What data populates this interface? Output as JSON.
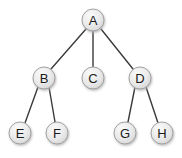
{
  "diagram": {
    "type": "tree",
    "title": "",
    "canvas": {
      "width": 182,
      "height": 158,
      "background": "#ffffff"
    },
    "style": {
      "node_fill_top": "#f2f2f2",
      "node_fill_bottom": "#d9d9d9",
      "node_stroke": "#9a9a9a",
      "node_radius": 11,
      "node_label_color": "#1a1a1a",
      "edge_color": "#3a3a3a",
      "edge_width": 1.4,
      "shadow_color": "#c9c9c9"
    },
    "nodes": [
      {
        "id": "A",
        "label": "A",
        "cx": 93,
        "cy": 20,
        "level": 0
      },
      {
        "id": "B",
        "label": "B",
        "cx": 44,
        "cy": 78,
        "level": 1
      },
      {
        "id": "C",
        "label": "C",
        "cx": 93,
        "cy": 78,
        "level": 1
      },
      {
        "id": "D",
        "label": "D",
        "cx": 140,
        "cy": 78,
        "level": 1
      },
      {
        "id": "E",
        "label": "E",
        "cx": 20,
        "cy": 133,
        "level": 2
      },
      {
        "id": "F",
        "label": "F",
        "cx": 57,
        "cy": 133,
        "level": 2
      },
      {
        "id": "G",
        "label": "G",
        "cx": 125,
        "cy": 133,
        "level": 2
      },
      {
        "id": "H",
        "label": "H",
        "cx": 162,
        "cy": 133,
        "level": 2
      }
    ],
    "edges": [
      {
        "from": "A",
        "to": "B",
        "x1": 86,
        "y1": 29,
        "x2": 51,
        "y2": 69
      },
      {
        "from": "A",
        "to": "C",
        "x1": 93,
        "y1": 31,
        "x2": 93,
        "y2": 67
      },
      {
        "from": "A",
        "to": "D",
        "x1": 101,
        "y1": 29,
        "x2": 133,
        "y2": 69
      },
      {
        "from": "B",
        "to": "E",
        "x1": 38,
        "y1": 87,
        "x2": 25,
        "y2": 123
      },
      {
        "from": "B",
        "to": "F",
        "x1": 49,
        "y1": 87,
        "x2": 55,
        "y2": 122
      },
      {
        "from": "D",
        "to": "G",
        "x1": 135,
        "y1": 87,
        "x2": 128,
        "y2": 122
      },
      {
        "from": "D",
        "to": "H",
        "x1": 146,
        "y1": 87,
        "x2": 158,
        "y2": 123
      }
    ]
  }
}
